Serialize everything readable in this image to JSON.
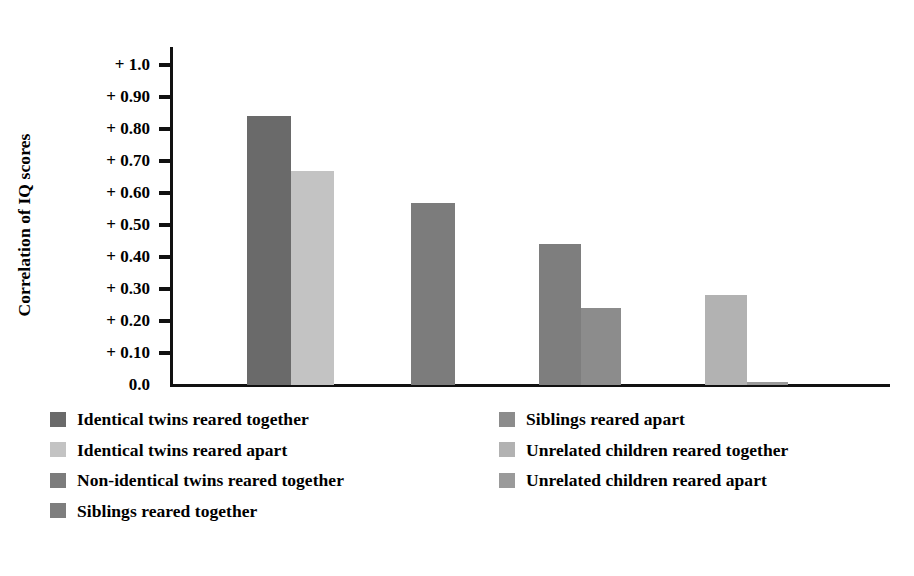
{
  "chart_data": {
    "type": "bar",
    "title": "",
    "subtitle": "",
    "xlabel": "",
    "ylabel": "Correlation of IQ scores",
    "ylim": [
      0.0,
      1.0
    ],
    "grid": false,
    "legend_position": "below-plot-two-columns",
    "ytick_labels": [
      "+ 1.0",
      "+ 0.90",
      "+ 0.80",
      "+ 0.70",
      "+ 0.60",
      "+ 0.50",
      "+ 0.40",
      "+ 0.30",
      "+ 0.20",
      "+ 0.10",
      "0.0"
    ],
    "ytick_values": [
      1.0,
      0.9,
      0.8,
      0.7,
      0.6,
      0.5,
      0.4,
      0.3,
      0.2,
      0.1,
      0.0
    ],
    "categories": [
      "Identical twins reared together",
      "Identical twins reared apart",
      "Non-identical twins reared together",
      "Siblings reared together",
      "Siblings reared apart",
      "Unrelated children reared together",
      "Unrelated children reared apart"
    ],
    "values": [
      0.84,
      0.67,
      0.57,
      0.44,
      0.24,
      0.28,
      0.01
    ],
    "colors": [
      "#6a6a6a",
      "#c3c3c3",
      "#7c7c7c",
      "#7e7e7e",
      "#8c8c8c",
      "#b2b2b2",
      "#9a9a9a"
    ],
    "bar_geometry": [
      {
        "left": 247,
        "width": 44
      },
      {
        "left": 291,
        "width": 43
      },
      {
        "left": 411,
        "width": 44
      },
      {
        "left": 539,
        "width": 42
      },
      {
        "left": 581,
        "width": 40
      },
      {
        "left": 705,
        "width": 42
      },
      {
        "left": 747,
        "width": 41
      }
    ]
  },
  "legend": {
    "left_column": [
      {
        "label": "Identical twins reared together",
        "color": "#6a6a6a"
      },
      {
        "label": "Identical twins reared apart",
        "color": "#c3c3c3"
      },
      {
        "label": "Non-identical twins reared together",
        "color": "#7c7c7c"
      },
      {
        "label": "Siblings reared together",
        "color": "#7e7e7e"
      }
    ],
    "right_column": [
      {
        "label": "Siblings reared apart",
        "color": "#8c8c8c"
      },
      {
        "label": "Unrelated children reared together",
        "color": "#b2b2b2"
      },
      {
        "label": "Unrelated children reared apart",
        "color": "#9a9a9a"
      }
    ]
  },
  "axes": {
    "baseline_y": 385,
    "top_y": 65,
    "pixels_per_unit": 320
  }
}
